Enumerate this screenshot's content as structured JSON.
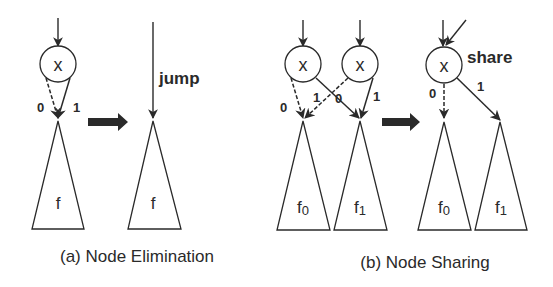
{
  "figure": {
    "panel_a": {
      "caption": "(a) Node Elimination",
      "before": {
        "node_label": "x",
        "edge_0_label": "0",
        "edge_1_label": "1",
        "subtree_label": "f"
      },
      "after": {
        "edge_annotation": "jump",
        "subtree_label": "f"
      }
    },
    "panel_b": {
      "caption": "(b) Node Sharing",
      "before": {
        "node_left_label": "x",
        "node_right_label": "x",
        "left_edge_0_label": "0",
        "left_edge_1_label": "1",
        "right_edge_0_label": "0",
        "right_edge_1_label": "1",
        "subtree_left_label": "f",
        "subtree_left_sub": "0",
        "subtree_right_label": "f",
        "subtree_right_sub": "1"
      },
      "after": {
        "node_label": "x",
        "node_annotation": "share",
        "edge_0_label": "0",
        "edge_1_label": "1",
        "subtree_left_label": "f",
        "subtree_left_sub": "0",
        "subtree_right_label": "f",
        "subtree_right_sub": "1"
      }
    },
    "colors": {
      "stroke": "#2a2a2a",
      "background": "#ffffff"
    }
  }
}
